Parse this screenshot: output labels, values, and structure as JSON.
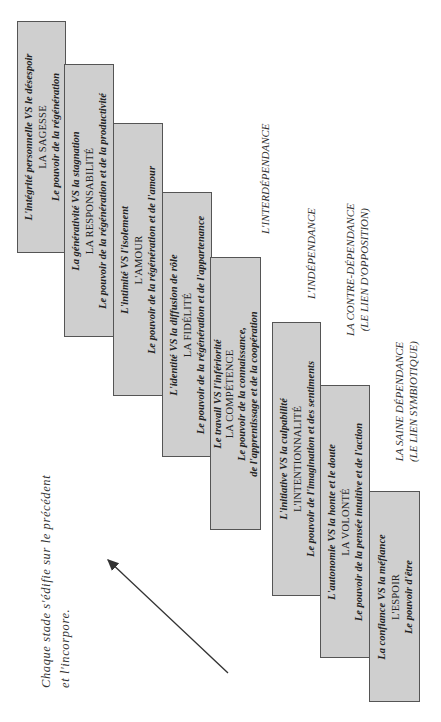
{
  "diagram": {
    "stages": [
      {
        "conflict": "L'intégrité personnelle VS le désespoir",
        "virtue": "LA SAGESSE",
        "power": [
          "Le pouvoir de la régénération"
        ]
      },
      {
        "conflict": "La générativité VS la stagnation",
        "virtue": "LA RESPONSABILITÉ",
        "power": [
          "Le pouvoir de la régénération et de la productivité"
        ]
      },
      {
        "conflict": "L'intimité VS l'isolement",
        "virtue": "L'AMOUR",
        "power": [
          "Le pouvoir de la régénération et de l'amour"
        ]
      },
      {
        "conflict": "L'identité VS la diffusion de rôle",
        "virtue": "LA FIDÉLITÉ",
        "power": [
          "Le pouvoir de la régénération et de l'appartenance"
        ]
      },
      {
        "conflict": "Le travail VS l'infériorité",
        "virtue": "LA COMPÉTENCE",
        "power": [
          "Le pouvoir de la connaissance,",
          "de l'apprentissage et de la coopération"
        ]
      },
      {
        "conflict": "L'initiative VS la culpabilité",
        "virtue": "L'INTENTIONNALITÉ",
        "power": [
          "Le pouvoir de l'imagination et des sentiments"
        ]
      },
      {
        "conflict": "L'autonomie VS la honte et le doute",
        "virtue": "LA VOLONTÉ",
        "power": [
          "Le pouvoir de la pensée intuitive et de l'action"
        ]
      },
      {
        "conflict": "La confiance VS la méfiance",
        "virtue": "L'ESPOIR",
        "power": [
          "Le pouvoir d'être"
        ]
      }
    ],
    "phases": [
      {
        "line1": "L'INTERDÉPENDANCE",
        "line2": ""
      },
      {
        "line1": "L'INDÉPENDANCE",
        "line2": ""
      },
      {
        "line1": "LA CONTRE-DÉPENDANCE",
        "line2": "(LE LIEN D'OPPOSITION)"
      },
      {
        "line1": "LA SAINE DÉPENDANCE",
        "line2": "(LE LIEN SYMBIOTIQUE)"
      }
    ],
    "caption": {
      "line1": "Chaque stade s'édifie sur le précédent",
      "line2": "et l'incorpore."
    },
    "colors": {
      "box_fill": "#cfcfcf",
      "box_border": "#555555",
      "arrow": "#333333"
    }
  }
}
